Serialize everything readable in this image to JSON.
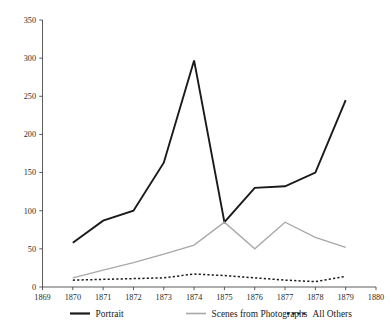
{
  "chart_data": {
    "type": "line",
    "title": "",
    "subtitle": "",
    "xlabel": "",
    "ylabel": "",
    "x": [
      1870,
      1871,
      1872,
      1873,
      1874,
      1875,
      1876,
      1877,
      1878,
      1879
    ],
    "xlim": [
      1869,
      1880
    ],
    "ylim": [
      0,
      350
    ],
    "xticks": [
      1869,
      1870,
      1871,
      1872,
      1873,
      1874,
      1875,
      1876,
      1877,
      1878,
      1879,
      1880
    ],
    "xticklabels": [
      "1869",
      "1870",
      "1871",
      "1872",
      "1873",
      "1874",
      "1875",
      "1876",
      "1877",
      "1878",
      "1879",
      "1880"
    ],
    "yticks": [
      0,
      50,
      100,
      150,
      200,
      250,
      300,
      350
    ],
    "yticklabels": [
      "0",
      "50",
      "100",
      "150",
      "200",
      "250",
      "300",
      "350"
    ],
    "grid": false,
    "legend_position": "bottom",
    "series": [
      {
        "name": "Portrait",
        "color": "#1a1a1a",
        "style": "solid",
        "width": 1.9,
        "values": [
          58,
          87,
          100,
          163,
          297,
          85,
          130,
          132,
          150,
          245
        ]
      },
      {
        "name": "Scenes from Photographs",
        "color": "#a8a8a8",
        "style": "solid",
        "width": 1.3,
        "values": [
          12,
          22,
          32,
          43,
          55,
          85,
          50,
          85,
          65,
          52
        ]
      },
      {
        "name": "All Others",
        "color": "#1a1a1a",
        "style": "dashed",
        "width": 1.5,
        "values": [
          9,
          10,
          11,
          12,
          17,
          15,
          12,
          9,
          7,
          14
        ]
      }
    ]
  },
  "legend": {
    "items": [
      {
        "label": "Portrait",
        "color": "#1a1a1a",
        "style": "solid",
        "width": 2.2
      },
      {
        "label": "Scenes from Photographs",
        "color": "#a8a8a8",
        "style": "solid",
        "width": 1.6
      },
      {
        "label": "All Others",
        "color": "#1a1a1a",
        "style": "dashed",
        "width": 1.8
      }
    ]
  }
}
